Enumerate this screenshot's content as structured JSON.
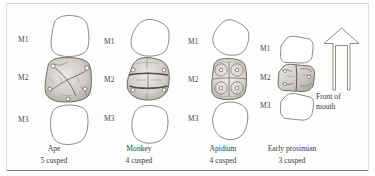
{
  "figure": {
    "row_labels": [
      "M1",
      "M2",
      "M3"
    ],
    "columns": [
      {
        "id": "ape",
        "name": "Ape",
        "name_italic": false,
        "cusp_text": "5 cusped",
        "cusp_count": 5,
        "molar_labels": [
          "M1",
          "M2",
          "M3"
        ],
        "detailed_molar": "M2",
        "crown_shape": "rounded-square",
        "pattern": "Y-5 pattern, five cusps"
      },
      {
        "id": "monkey",
        "name": "Monkey",
        "name_italic": false,
        "cusp_text": "4 cusped",
        "cusp_count": 4,
        "molar_labels": [
          "M1",
          "M2",
          "M3"
        ],
        "detailed_molar": "M2",
        "crown_shape": "rounded-oval",
        "pattern": "bilophodont, four cusps"
      },
      {
        "id": "apidium",
        "name": "Apidium",
        "name_italic": true,
        "cusp_text": "4 cusped",
        "cusp_count": 4,
        "molar_labels": [
          "M1",
          "M2",
          "M3"
        ],
        "detailed_molar": "M2",
        "crown_shape": "rounded-rectangle",
        "pattern": "four discrete rounded cusps"
      },
      {
        "id": "early-prosimian",
        "name": "Early prosimian",
        "name_italic": false,
        "cusp_text": "3 cusped",
        "cusp_count": 3,
        "molar_labels": [
          "M1",
          "M2",
          "M3"
        ],
        "detailed_molar": "M2",
        "crown_shape": "angular-trapezoid",
        "pattern": "tribosphenic, three cusps"
      }
    ],
    "direction_indicator": {
      "icon": "up-arrow-icon",
      "label_line1": "Front of",
      "label_line2": "mouth"
    },
    "colors": {
      "outline": "#6f6f6d",
      "text": "#3c3c3a",
      "background": "#fdfdfc",
      "shading": "#b9b7b2"
    }
  }
}
